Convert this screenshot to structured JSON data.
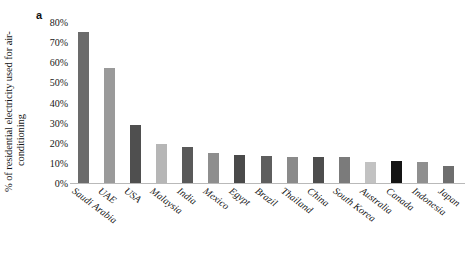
{
  "panel": {
    "label": "a"
  },
  "axis": {
    "ylabel_line1": "% of residential electricity used for air-",
    "ylabel_line2": "conditioning",
    "yticks": [
      "0%",
      "10%",
      "20%",
      "30%",
      "40%",
      "50%",
      "60%",
      "70%",
      "80%"
    ]
  },
  "chart_data": {
    "type": "bar",
    "title": "",
    "xlabel": "",
    "ylabel": "% of residential electricity used for air-conditioning",
    "ylim": [
      0,
      80
    ],
    "ytick_values": [
      0,
      10,
      20,
      30,
      40,
      50,
      60,
      70,
      80
    ],
    "ytick_labels": [
      "0%",
      "10%",
      "20%",
      "30%",
      "40%",
      "50%",
      "60%",
      "70%",
      "80%"
    ],
    "grid": false,
    "legend": "none",
    "units": "percent",
    "categories": [
      "Saudi Arabia",
      "UAE",
      "USA",
      "Malaysia",
      "India",
      "Mexico",
      "Egypt",
      "Brazil",
      "Thailand",
      "China",
      "South Korea",
      "Australia",
      "Canada",
      "Indonesia",
      "Japan"
    ],
    "values": [
      75,
      57,
      29,
      19.5,
      18,
      15,
      14,
      13.5,
      13,
      13,
      13,
      10.5,
      11,
      10.5,
      8.5
    ],
    "bar_colors": [
      "#6b6b6b",
      "#9a9a9a",
      "#4f4f4f",
      "#b6b6b6",
      "#595959",
      "#8e8e8e",
      "#4a4a4a",
      "#5e5e5e",
      "#8a8a8a",
      "#4d4d4d",
      "#7b7b7b",
      "#c2c2c2",
      "#141414",
      "#8f8f8f",
      "#6e6e6e"
    ]
  }
}
